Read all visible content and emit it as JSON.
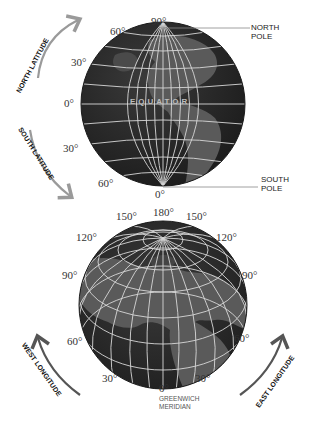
{
  "top_globe": {
    "latitude_labels": {
      "north_90": "90°",
      "north_60": "60°",
      "north_30": "30°",
      "equator_0": "0°",
      "south_30": "30°",
      "south_60": "60°",
      "south_0_bottom": "0°"
    },
    "equator_label": "EQUATOR",
    "north_pole": [
      "NORTH",
      "POLE"
    ],
    "south_pole": [
      "SOUTH",
      "POLE"
    ],
    "north_arrow_label": "NORTH LATITUDE",
    "south_arrow_label": "SOUTH LATITUDE"
  },
  "bottom_globe": {
    "longitude_labels": {
      "top_180": "180°",
      "top_left_150": "150°",
      "top_right_150": "150°",
      "left_120": "120°",
      "right_120": "120°",
      "left_90": "90°",
      "right_90": "90°",
      "left_60": "60°",
      "right_60": "60°",
      "left_30": "30°",
      "right_30": "30°",
      "bottom_0": "0°"
    },
    "meridian_caption": [
      "GREENWICH",
      "MERIDIAN"
    ],
    "west_arrow_label": "WEST LONGITUDE",
    "east_arrow_label": "EAST LONGITUDE"
  },
  "colors": {
    "globe_dark": "#2b2b2b",
    "land": "#5a5a5a",
    "grid": "#d8d8d8",
    "arrow_light": "#9a9a9a",
    "arrow_dark": "#555555"
  }
}
